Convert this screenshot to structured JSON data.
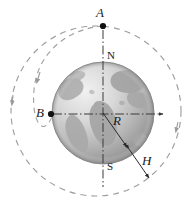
{
  "figure": {
    "type": "diagram",
    "background_color": "#ffffff",
    "width": 191,
    "height": 208
  },
  "labels": {
    "point_a": "A",
    "point_b": "B",
    "north_pole": "N",
    "south_pole": "S",
    "earth_radius": "R",
    "orbit_altitude": "H"
  },
  "elements": {
    "earth": {
      "name": "earth-sphere",
      "center": [
        103,
        113
      ],
      "radius": 51,
      "fill_light": "#e9e9e9",
      "fill_mid": "#b9b9b9",
      "fill_dark": "#9a9a9a",
      "outline_color": "#8c8c8c",
      "continent_color": "#a7a7a7"
    },
    "orbit_outer": {
      "name": "outer-orbit-circle",
      "center": [
        96,
        111
      ],
      "radius": 85,
      "style": "dashed",
      "color": "#9b9b9b",
      "direction_arrows": 2
    },
    "orbit_inner": {
      "name": "inner-tilted-orbit-ellipse",
      "style": "dashed",
      "color": "#9b9b9b",
      "direction_arrows": 1
    },
    "axis_polar": {
      "name": "polar-axis",
      "style": "dash-dot",
      "color": "#3a3a3a",
      "from": [
        103,
        26
      ],
      "to": [
        103,
        187
      ]
    },
    "axis_equatorial": {
      "name": "equatorial-axis",
      "style": "dash-dot",
      "color": "#3a3a3a",
      "from": [
        51,
        114
      ],
      "to": [
        167,
        114
      ]
    },
    "radius_arrow": {
      "name": "radius-arrow-R",
      "from": [
        103,
        113
      ],
      "to": [
        129,
        149
      ],
      "arrowheads": "end"
    },
    "altitude_arrow": {
      "name": "altitude-arrow-H",
      "from": [
        128,
        148
      ],
      "to": [
        150,
        179
      ],
      "arrowheads": "both"
    },
    "dot_a": {
      "name": "point-a-dot",
      "at": [
        103,
        26
      ],
      "color": "#111111"
    },
    "dot_b": {
      "name": "point-b-dot",
      "at": [
        51,
        114
      ],
      "color": "#111111"
    }
  },
  "label_positions": {
    "point_a": {
      "x": 96,
      "y": 6
    },
    "point_b": {
      "x": 36,
      "y": 107
    },
    "north_pole": {
      "x": 107,
      "y": 51
    },
    "south_pole": {
      "x": 107,
      "y": 162
    },
    "earth_radius": {
      "x": 113,
      "y": 115
    },
    "orbit_altitude": {
      "x": 142,
      "y": 155
    }
  }
}
